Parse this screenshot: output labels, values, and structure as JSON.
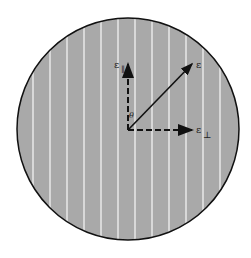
{
  "diagram": {
    "labels": {
      "field": "ε",
      "parallel": "ε",
      "parallel_sub": "∥",
      "perpendicular": "ε",
      "perpendicular_sub": "⊥",
      "angle": "θ"
    },
    "colors": {
      "disk_fill": "#a9a9a9",
      "lines": "#ededed",
      "outline": "#111111",
      "arrows": "#111111"
    },
    "transmission_axis": "vertical",
    "field_angle_deg": 45
  }
}
